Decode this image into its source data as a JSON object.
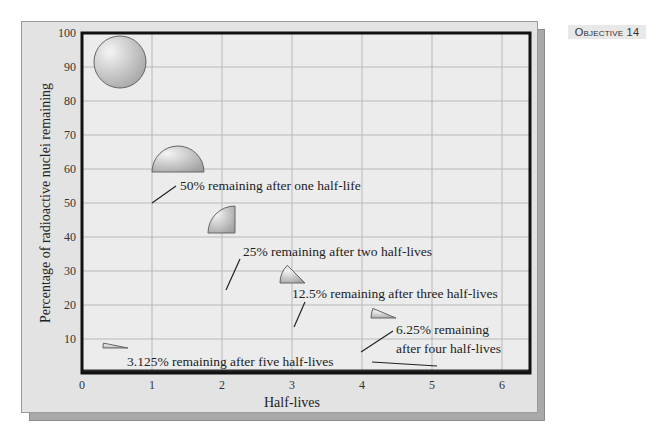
{
  "objective_badge": "Objective 14",
  "chart_data": {
    "type": "line",
    "title": "",
    "xlabel": "Half-lives",
    "ylabel": "Percentage of radioactive nuclei remaining",
    "xlim": [
      0,
      6.4
    ],
    "ylim": [
      0,
      100
    ],
    "x_ticks": [
      "0",
      "1",
      "2",
      "3",
      "4",
      "5",
      "6"
    ],
    "y_ticks": [
      "10",
      "20",
      "30",
      "40",
      "50",
      "60",
      "70",
      "80",
      "90",
      "100"
    ],
    "grid": true,
    "series": [
      {
        "name": "Radioactive decay",
        "x": [
          0,
          1,
          2,
          3,
          4,
          5,
          6
        ],
        "values": [
          100,
          50,
          25,
          12.5,
          6.25,
          3.125,
          1.5625
        ]
      }
    ],
    "annotations": [
      {
        "text": "50% remaining after one half-life",
        "x": 1,
        "y": 50
      },
      {
        "text": "25% remaining after two half-lives",
        "x": 2,
        "y": 25
      },
      {
        "text": "12.5% remaining after three half-lives",
        "x": 3,
        "y": 12.5
      },
      {
        "text": "6.25% remaining",
        "text2": "after four half-lives",
        "x": 4,
        "y": 6.25
      },
      {
        "text": "3.125% remaining after five half-lives",
        "x": 5,
        "y": 3.125
      }
    ],
    "pie_icons": [
      {
        "fraction": 1.0,
        "name": "full-circle"
      },
      {
        "fraction": 0.5,
        "name": "half-circle"
      },
      {
        "fraction": 0.25,
        "name": "quarter-circle"
      },
      {
        "fraction": 0.125,
        "name": "eighth-circle"
      },
      {
        "fraction": 0.0625,
        "name": "sixteenth-circle"
      },
      {
        "fraction": 0.03125,
        "name": "thirty-second-circle"
      }
    ]
  }
}
